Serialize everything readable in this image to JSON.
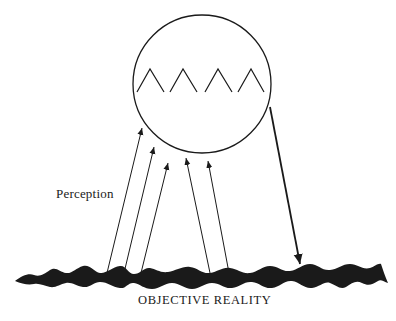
{
  "diagram": {
    "perception_label": "Perception",
    "reality_label": "OBJECTIVE REALITY",
    "colors": {
      "ink": "#1a1a1a",
      "background": "#ffffff"
    },
    "mind_circle": {
      "cx": 202,
      "cy": 84,
      "r": 69
    },
    "inner_peaks": 4,
    "perception_arrows": [
      {
        "from": [
          107,
          273
        ],
        "to": [
          142,
          128
        ]
      },
      {
        "from": [
          124,
          273
        ],
        "to": [
          154,
          147
        ]
      },
      {
        "from": [
          141,
          273
        ],
        "to": [
          168,
          163
        ]
      },
      {
        "from": [
          210,
          273
        ],
        "to": [
          186,
          158
        ]
      },
      {
        "from": [
          229,
          273
        ],
        "to": [
          208,
          161
        ]
      }
    ],
    "action_arrow": {
      "from": [
        270,
        107
      ],
      "to": [
        300,
        262
      ]
    }
  }
}
